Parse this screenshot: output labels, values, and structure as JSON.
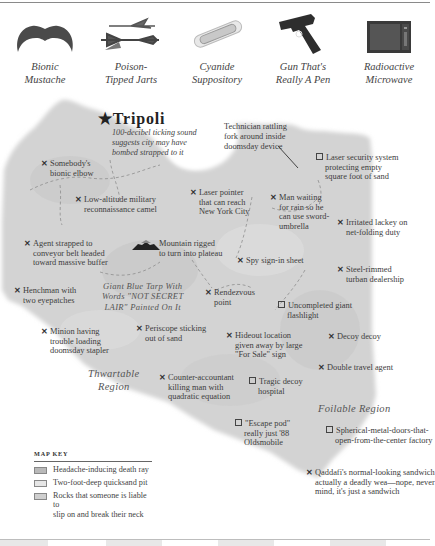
{
  "gadgets": [
    {
      "icon": "mustache-icon",
      "label_line1": "Bionic",
      "label_line2": "Mustache"
    },
    {
      "icon": "darts-icon",
      "label_line1": "Poison-",
      "label_line2": "Tipped Jarts"
    },
    {
      "icon": "capsule-icon",
      "label_line1": "Cyanide",
      "label_line2": "Suppository"
    },
    {
      "icon": "pistol-icon",
      "label_line1": "Gun That's",
      "label_line2": "Really A Pen"
    },
    {
      "icon": "microwave-icon",
      "label_line1": "Radioactive",
      "label_line2": "Microwave"
    }
  ],
  "city": {
    "name": "Tripoli",
    "note_line1": "100-decibel ticking sound",
    "note_line2": "suggests city may have",
    "note_line3": "bombed strapped to it"
  },
  "technician_note": {
    "line1": "Technician rattling",
    "line2": "fork around inside",
    "line3": "doomsday device"
  },
  "markers": {
    "elbow": {
      "type": "x",
      "line1": "Somebody's",
      "line2": "bionic elbow"
    },
    "camel": {
      "type": "x",
      "line1": "Low-altitude military",
      "line2": "reconnaissance camel"
    },
    "laser_pointer": {
      "type": "x",
      "line1": "Laser pointer",
      "line2": "that can reach",
      "line3": "New York City"
    },
    "laser_security": {
      "type": "square",
      "line1": "Laser security system",
      "line2": "protecting empty",
      "line3": "square foot of sand"
    },
    "man_waiting": {
      "type": "x",
      "line1": "Man waiting",
      "line2": "for rain so he",
      "line3": "can use sword-",
      "line4": "umbrella"
    },
    "lackey": {
      "type": "x",
      "line1": "Irritated lackey on",
      "line2": "net-folding duty"
    },
    "agent": {
      "type": "x",
      "line1": "Agent strapped to",
      "line2": "conveyor belt headed",
      "line3": "toward massive buffer"
    },
    "mountain": {
      "type": "mountain",
      "line1": "Mountain rigged",
      "line2": "to turn into plateau"
    },
    "spy_sign": {
      "type": "x",
      "line1": "Spy sign-in sheet"
    },
    "turban": {
      "type": "x",
      "line1": "Steel-rimmed",
      "line2": "turban dealership"
    },
    "henchman": {
      "type": "x",
      "line1": "Henchman with",
      "line2": "two eyepatches"
    },
    "rendezvous": {
      "type": "x",
      "line1": "Rendezvous",
      "line2": "point"
    },
    "flashlight": {
      "type": "square",
      "line1": "Uncompleted giant",
      "line2": "flashlight"
    },
    "minion": {
      "type": "x",
      "line1": "Minion having",
      "line2": "trouble loading",
      "line3": "doomsday stapler"
    },
    "periscope": {
      "type": "x",
      "line1": "Periscope sticking",
      "line2": "out of sand"
    },
    "hideout": {
      "type": "x",
      "line1": "Hideout location",
      "line2": "given away by large",
      "line3": "\"For Sale\" sign"
    },
    "decoy": {
      "type": "x",
      "line1": "Decoy decoy"
    },
    "travel_agent": {
      "type": "x",
      "line1": "Double travel agent"
    },
    "accountant": {
      "type": "x",
      "line1": "Counter-accountant",
      "line2": "killing man with",
      "line3": "quadratic equation"
    },
    "hospital": {
      "type": "square",
      "line1": "Tragic decoy",
      "line2": "hospital"
    },
    "escape_pod": {
      "type": "square",
      "line1": "\"Escape pod\"",
      "line2": "really just '88",
      "line3": "Oldsmobile"
    },
    "factory": {
      "type": "square",
      "line1": "Spherical-metal-doors-that-",
      "line2": "open-from-the-center factory"
    },
    "sandwich": {
      "type": "x",
      "line1": "Qaddafi's normal-looking sandwich",
      "line2": "actually a deadly wea—nope, never",
      "line3": "mind, it's just a sandwich"
    }
  },
  "tarp": {
    "line1": "Giant Blue Tarp With",
    "line2": "Words \"NOT SECRET",
    "line3": "LAIR\" Painted On It"
  },
  "regions": {
    "thwartable_line1": "Thwartable",
    "thwartable_line2": "Region",
    "foilable": "Foilable Region"
  },
  "map_key": {
    "title": "MAP KEY",
    "items": [
      {
        "label_line1": "Headache-inducing death ray",
        "label_line2": "",
        "color": "#b9b9b9"
      },
      {
        "label_line1": "Two-foot-deep quicksand pit",
        "label_line2": "",
        "color": "#e6e6e6"
      },
      {
        "label_line1": "Rocks that someone is liable to",
        "label_line2": "slip on and break their neck",
        "color": "#cfcfcf"
      }
    ]
  },
  "symbols": {
    "x_mark": "✕",
    "star": "★"
  },
  "colors": {
    "land": "#d3d3d3",
    "land_dark": "#c2c2c2",
    "land_light": "#e2e2e2",
    "text": "#3a3a3a"
  }
}
